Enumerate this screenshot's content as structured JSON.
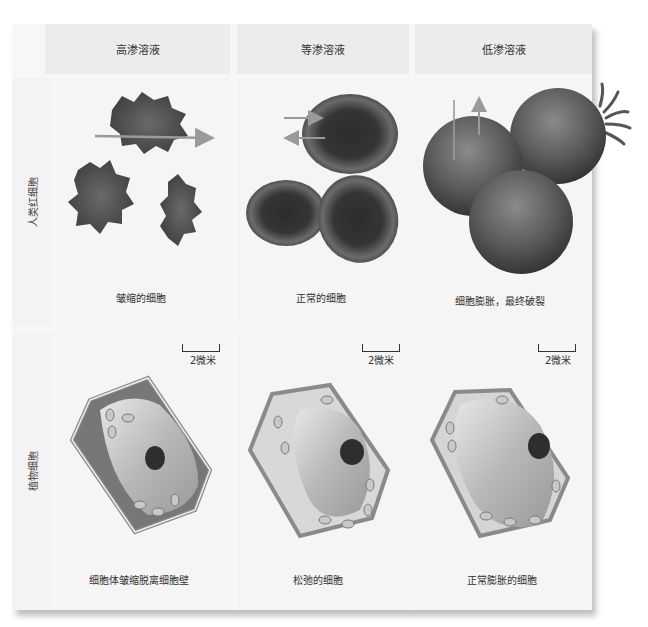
{
  "columns": [
    {
      "header": "高渗溶液",
      "rbc_caption": "皱缩的细胞",
      "plant_caption": "细胞体皱缩脱离细胞壁",
      "scale": "2微米"
    },
    {
      "header": "等渗溶液",
      "rbc_caption": "正常的细胞",
      "plant_caption": "松弛的细胞",
      "scale": "2微米"
    },
    {
      "header": "低渗溶液",
      "rbc_caption": "细胞膨胀，最终破裂",
      "plant_caption": "正常膨胀的细胞",
      "scale": "2微米"
    }
  ],
  "rows": {
    "rbc_label": "人类红细胞",
    "plant_label": "植物细胞"
  },
  "colors": {
    "header_bg": "#ececec",
    "panel_bg": "#f5f5f5",
    "rbc_dark": "#3a3a3a",
    "rbc_mid": "#6a6a6a",
    "arrow": "#9a9a9a",
    "plant_wall": "#8a8a8a"
  }
}
